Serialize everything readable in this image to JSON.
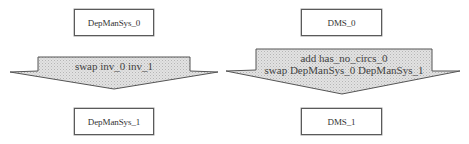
{
  "diagram": {
    "left": {
      "top_box": "DepManSys_0",
      "transition_lines": [
        "swap inv_0 inv_1"
      ],
      "bottom_box": "DepManSys_1"
    },
    "right": {
      "top_box": "DMS_0",
      "transition_lines": [
        "add has_no_circs_0",
        "swap DepManSys_0 DepManSys_1"
      ],
      "bottom_box": "DMS_1"
    }
  },
  "colors": {
    "box_border": "#5a5a5a",
    "arrow_fill": "#d4d4d4",
    "arrow_stroke": "#555555",
    "text": "#333333"
  }
}
